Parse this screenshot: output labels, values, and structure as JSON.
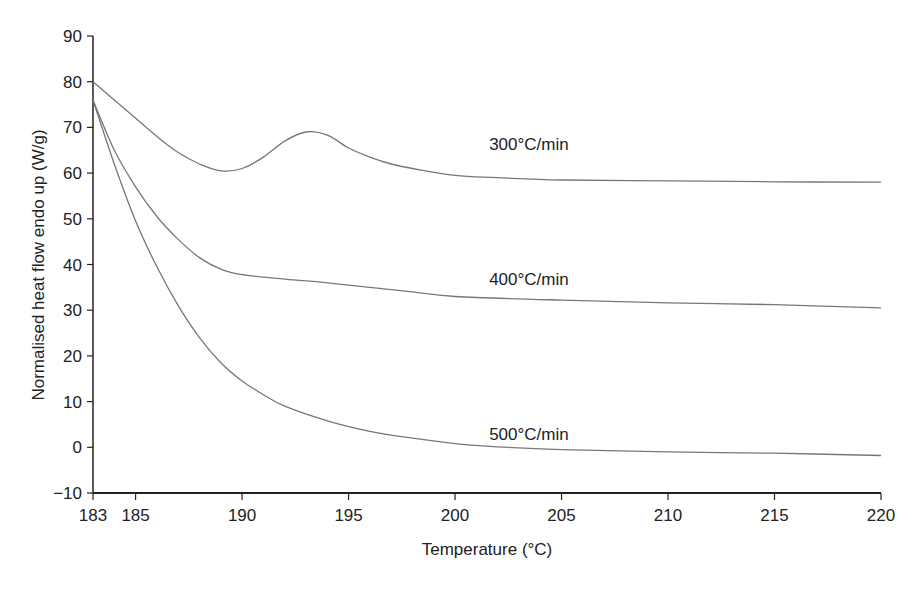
{
  "chart_data": {
    "type": "line",
    "title": "",
    "xlabel": "Temperature (°C)",
    "ylabel": "Normalised heat flow endo up (W/g)",
    "xlim": [
      183,
      220
    ],
    "ylim": [
      -10,
      90
    ],
    "xticks": [
      183,
      185,
      190,
      195,
      200,
      205,
      210,
      215,
      220
    ],
    "yticks": [
      -10,
      0,
      10,
      20,
      30,
      40,
      50,
      60,
      70,
      80,
      90
    ],
    "grid": false,
    "legend": "inline labels",
    "series": [
      {
        "name": "300°C/min",
        "label_pos": [
          201.6,
          65
        ],
        "x": [
          183,
          184,
          185,
          186,
          187,
          188,
          189,
          190,
          191,
          192,
          193,
          194,
          195,
          196,
          197,
          198,
          200,
          202,
          205,
          210,
          215,
          220
        ],
        "values": [
          80,
          76,
          72,
          68,
          64.5,
          62,
          60.5,
          61,
          63.5,
          67,
          69,
          68.3,
          65.5,
          63.5,
          62,
          61,
          59.5,
          59,
          58.5,
          58.3,
          58.1,
          58
        ]
      },
      {
        "name": "400°C/min",
        "label_pos": [
          201.6,
          35.5
        ],
        "x": [
          183,
          184,
          185,
          186,
          187,
          188,
          189,
          190,
          192,
          194,
          196,
          198,
          200,
          205,
          210,
          215,
          220
        ],
        "values": [
          76,
          65,
          57,
          50.5,
          45.5,
          41.5,
          39,
          37.8,
          36.8,
          36,
          35,
          34,
          33,
          32.2,
          31.6,
          31.2,
          30.5
        ]
      },
      {
        "name": "500°C/min",
        "label_pos": [
          201.6,
          1.5
        ],
        "x": [
          183,
          184,
          185,
          186,
          187,
          188,
          189,
          190,
          191,
          192,
          194,
          196,
          198,
          200,
          202,
          205,
          210,
          215,
          220
        ],
        "values": [
          76,
          62,
          49.5,
          39.5,
          31,
          24,
          18.5,
          14.5,
          11.5,
          9,
          5.8,
          3.5,
          2,
          0.8,
          0.1,
          -0.5,
          -1,
          -1.3,
          -1.8
        ]
      }
    ]
  },
  "style": {
    "line_color": "#777777",
    "axis_color": "#222222"
  }
}
